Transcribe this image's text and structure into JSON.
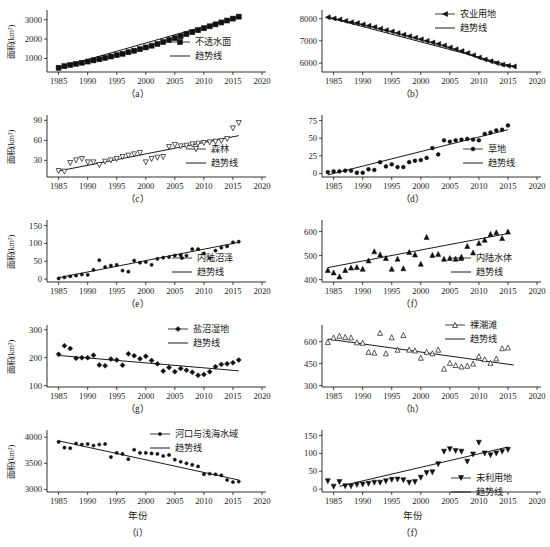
{
  "figure": {
    "y_axis_label": "面积(km²)",
    "x_axis_label": "年份",
    "trend_legend_label": "趋势线",
    "axis_color": "#1a1a1a"
  },
  "panels": [
    {
      "id": "a",
      "label": "（a）",
      "series_name": "不透水面",
      "marker": "square",
      "show_y_label": true,
      "show_x_label": false,
      "legend_x": 170,
      "legend_y": 42
    },
    {
      "id": "b",
      "label": "（b）",
      "series_name": "农业用地",
      "marker": "left-triangle",
      "show_y_label": false,
      "show_x_label": false,
      "legend_x": 160,
      "legend_y": 14
    },
    {
      "id": "c",
      "label": "（c）",
      "series_name": "森林",
      "marker": "down-triangle-open",
      "show_y_label": true,
      "show_x_label": false,
      "legend_x": 186,
      "legend_y": 44
    },
    {
      "id": "d",
      "label": "（d）",
      "series_name": "草地",
      "marker": "circle",
      "show_y_label": false,
      "show_x_label": false,
      "legend_x": 188,
      "legend_y": 44
    },
    {
      "id": "e",
      "label": "（e）",
      "series_name": "内陆沼泽",
      "marker": "dot",
      "show_y_label": true,
      "show_x_label": false,
      "legend_x": 172,
      "legend_y": 48
    },
    {
      "id": "f",
      "label": "（f）",
      "series_name": "内陆水体",
      "marker": "up-triangle",
      "show_y_label": false,
      "show_x_label": false,
      "legend_x": 176,
      "legend_y": 48
    },
    {
      "id": "g",
      "label": "（g）",
      "series_name": "盐沼湿地",
      "marker": "diamond",
      "show_y_label": true,
      "show_x_label": false,
      "legend_x": 168,
      "legend_y": 14
    },
    {
      "id": "h",
      "label": "（h）",
      "series_name": "裸潮滩",
      "marker": "up-triangle-open",
      "show_y_label": false,
      "show_x_label": false,
      "legend_x": 170,
      "legend_y": 10
    },
    {
      "id": "i",
      "label": "（i）",
      "series_name": "河口与浅海水域",
      "marker": "dot",
      "show_y_label": true,
      "show_x_label": true,
      "legend_x": 150,
      "legend_y": 14
    },
    {
      "id": "j",
      "label": "（f）",
      "series_name": "未利用地",
      "marker": "down-triangle",
      "show_y_label": false,
      "show_x_label": true,
      "legend_x": 176,
      "legend_y": 58
    }
  ],
  "chart_data": [
    {
      "type": "scatter",
      "panel": "a",
      "title": "（a）",
      "series_name": "不透水面",
      "trend_name": "趋势线",
      "xlabel": "",
      "ylabel": "面积(km²)",
      "xlim": [
        1983,
        2020
      ],
      "ylim": [
        300,
        3400
      ],
      "xticks": [
        1985,
        1990,
        1995,
        2000,
        2005,
        2010,
        2015,
        2020
      ],
      "yticks": [
        1000,
        2000,
        3000
      ],
      "x": [
        1985,
        1986,
        1987,
        1988,
        1989,
        1990,
        1991,
        1992,
        1993,
        1994,
        1995,
        1996,
        1997,
        1998,
        1999,
        2000,
        2001,
        2002,
        2003,
        2004,
        2005,
        2006,
        2007,
        2008,
        2009,
        2010,
        2011,
        2012,
        2013,
        2014,
        2015,
        2016
      ],
      "y": [
        520,
        600,
        660,
        720,
        780,
        840,
        900,
        960,
        1030,
        1100,
        1170,
        1240,
        1320,
        1400,
        1480,
        1570,
        1660,
        1750,
        1850,
        1950,
        2050,
        2150,
        2260,
        2360,
        2460,
        2560,
        2660,
        2760,
        2860,
        2960,
        3060,
        3160
      ],
      "trend": {
        "x": [
          1985,
          2016
        ],
        "y": [
          520,
          3160
        ]
      },
      "connected": true
    },
    {
      "type": "scatter",
      "panel": "b",
      "title": "（b）",
      "series_name": "农业用地",
      "trend_name": "趋势线",
      "xlabel": "",
      "ylabel": "",
      "xlim": [
        1983,
        2020
      ],
      "ylim": [
        5600,
        8300
      ],
      "xticks": [
        1985,
        1990,
        1995,
        2000,
        2005,
        2010,
        2015,
        2020
      ],
      "yticks": [
        6000,
        7000,
        8000
      ],
      "x": [
        1984,
        1985,
        1986,
        1987,
        1988,
        1989,
        1990,
        1991,
        1992,
        1993,
        1994,
        1995,
        1996,
        1997,
        1998,
        1999,
        2000,
        2001,
        2002,
        2003,
        2004,
        2005,
        2006,
        2007,
        2008,
        2009,
        2010,
        2011,
        2012,
        2013,
        2014,
        2015,
        2016
      ],
      "y": [
        8060,
        8010,
        7960,
        7900,
        7840,
        7800,
        7740,
        7680,
        7620,
        7550,
        7480,
        7420,
        7350,
        7280,
        7210,
        7140,
        7070,
        7000,
        6930,
        6860,
        6790,
        6700,
        6620,
        6540,
        6450,
        6350,
        6250,
        6160,
        6080,
        6000,
        5930,
        5880,
        5850
      ],
      "trend": {
        "x": [
          1984,
          2016
        ],
        "y": [
          8060,
          5850
        ]
      },
      "connected": true
    },
    {
      "type": "scatter",
      "panel": "c",
      "title": "（c）",
      "series_name": "森林",
      "trend_name": "趋势线",
      "xlabel": "",
      "ylabel": "面积(km²)",
      "xlim": [
        1983,
        2020
      ],
      "ylim": [
        5,
        95
      ],
      "xticks": [
        1985,
        1990,
        1995,
        2000,
        2005,
        2010,
        2015,
        2020
      ],
      "yticks": [
        30,
        60,
        90
      ],
      "x": [
        1985,
        1986,
        1987,
        1988,
        1989,
        1990,
        1991,
        1992,
        1993,
        1994,
        1995,
        1996,
        1997,
        1998,
        1999,
        2000,
        2001,
        2002,
        2003,
        2004,
        2005,
        2006,
        2007,
        2008,
        2009,
        2010,
        2011,
        2012,
        2013,
        2014,
        2015,
        2016
      ],
      "y": [
        14,
        13,
        26,
        30,
        32,
        27,
        27,
        23,
        28,
        30,
        32,
        35,
        37,
        39,
        41,
        27,
        32,
        34,
        35,
        50,
        53,
        51,
        52,
        54,
        55,
        56,
        57,
        58,
        59,
        62,
        78,
        86
      ],
      "trend": {
        "x": [
          1985,
          2016
        ],
        "y": [
          14,
          67
        ]
      },
      "connected": false
    },
    {
      "type": "scatter",
      "panel": "d",
      "title": "（d）",
      "series_name": "草地",
      "trend_name": "趋势线",
      "xlabel": "",
      "ylabel": "",
      "xlim": [
        1983,
        2020
      ],
      "ylim": [
        -5,
        80
      ],
      "xticks": [
        1985,
        1990,
        1995,
        2000,
        2005,
        2010,
        2015,
        2020
      ],
      "yticks": [
        0,
        25,
        50,
        75
      ],
      "x": [
        1984,
        1985,
        1986,
        1987,
        1988,
        1989,
        1990,
        1991,
        1992,
        1993,
        1994,
        1995,
        1996,
        1997,
        1998,
        1999,
        2000,
        2001,
        2002,
        2003,
        2004,
        2005,
        2006,
        2007,
        2008,
        2009,
        2010,
        2011,
        2012,
        2013,
        2014,
        2015
      ],
      "y": [
        2,
        3,
        3,
        4,
        4,
        1,
        1,
        6,
        5,
        16,
        10,
        13,
        9,
        9,
        16,
        18,
        19,
        22,
        36,
        27,
        47,
        45,
        47,
        48,
        49,
        48,
        47,
        56,
        58,
        61,
        62,
        68
      ],
      "trend": {
        "x": [
          1984,
          2015
        ],
        "y": [
          -2,
          62
        ]
      },
      "connected": false
    },
    {
      "type": "scatter",
      "panel": "e",
      "title": "（e）",
      "series_name": "内陆沼泽",
      "trend_name": "趋势线",
      "xlabel": "",
      "ylabel": "面积(km²)",
      "xlim": [
        1983,
        2020
      ],
      "ylim": [
        -8,
        160
      ],
      "xticks": [
        1985,
        1990,
        1995,
        2000,
        2005,
        2010,
        2015,
        2020
      ],
      "yticks": [
        0,
        50,
        100,
        150
      ],
      "x": [
        1985,
        1986,
        1987,
        1988,
        1989,
        1990,
        1991,
        1992,
        1993,
        1994,
        1995,
        1996,
        1997,
        1998,
        1999,
        2000,
        2001,
        2002,
        2003,
        2004,
        2005,
        2006,
        2007,
        2008,
        2009,
        2010,
        2011,
        2012,
        2013,
        2014,
        2015,
        2016
      ],
      "y": [
        2,
        5,
        8,
        10,
        13,
        12,
        26,
        53,
        34,
        38,
        40,
        24,
        21,
        52,
        46,
        48,
        40,
        57,
        60,
        62,
        66,
        67,
        66,
        84,
        84,
        72,
        59,
        80,
        88,
        92,
        103,
        105
      ],
      "trend": {
        "x": [
          1985,
          2016
        ],
        "y": [
          4,
          103
        ]
      },
      "connected": false
    },
    {
      "type": "scatter",
      "panel": "f",
      "title": "（f）",
      "series_name": "内陆水体",
      "trend_name": "趋势线",
      "xlabel": "",
      "ylabel": "",
      "xlim": [
        1983,
        2020
      ],
      "ylim": [
        390,
        640
      ],
      "xticks": [
        1985,
        1990,
        1995,
        2000,
        2005,
        2010,
        2015,
        2020
      ],
      "yticks": [
        400,
        500,
        600
      ],
      "x": [
        1984,
        1985,
        1986,
        1987,
        1988,
        1989,
        1990,
        1991,
        1992,
        1993,
        1994,
        1995,
        1996,
        1997,
        1998,
        1999,
        2000,
        2001,
        2002,
        2003,
        2004,
        2005,
        2006,
        2007,
        2008,
        2009,
        2010,
        2011,
        2012,
        2013,
        2014,
        2015
      ],
      "y": [
        440,
        430,
        413,
        440,
        450,
        452,
        445,
        480,
        518,
        505,
        490,
        445,
        487,
        447,
        515,
        505,
        466,
        578,
        503,
        507,
        487,
        490,
        487,
        495,
        540,
        513,
        553,
        566,
        590,
        597,
        573,
        600
      ],
      "trend": {
        "x": [
          1984,
          2015
        ],
        "y": [
          450,
          592
        ]
      },
      "connected": false
    },
    {
      "type": "scatter",
      "panel": "g",
      "title": "（g）",
      "series_name": "盐沼湿地",
      "trend_name": "趋势线",
      "xlabel": "",
      "ylabel": "面积(km²)",
      "xlim": [
        1983,
        2020
      ],
      "ylim": [
        95,
        310
      ],
      "xticks": [
        1985,
        1990,
        1995,
        2000,
        2005,
        2010,
        2015,
        2020
      ],
      "yticks": [
        100,
        200,
        300
      ],
      "x": [
        1985,
        1986,
        1987,
        1988,
        1989,
        1990,
        1991,
        1992,
        1993,
        1994,
        1995,
        1996,
        1997,
        1998,
        1999,
        2000,
        2001,
        2002,
        2003,
        2004,
        2005,
        2006,
        2007,
        2008,
        2009,
        2010,
        2011,
        2012,
        2013,
        2014,
        2015,
        2016
      ],
      "y": [
        212,
        243,
        233,
        198,
        200,
        200,
        209,
        174,
        171,
        195,
        192,
        173,
        214,
        207,
        196,
        205,
        190,
        178,
        152,
        165,
        150,
        161,
        155,
        148,
        137,
        140,
        150,
        168,
        176,
        178,
        182,
        192
      ],
      "trend": {
        "x": [
          1985,
          2016
        ],
        "y": [
          208,
          153
        ]
      },
      "connected": false
    },
    {
      "type": "scatter",
      "panel": "h",
      "title": "（h）",
      "series_name": "裸潮滩",
      "trend_name": "趋势线",
      "xlabel": "",
      "ylabel": "",
      "xlim": [
        1983,
        2020
      ],
      "ylim": [
        290,
        700
      ],
      "xticks": [
        1985,
        1990,
        1995,
        2000,
        2005,
        2010,
        2015,
        2020
      ],
      "yticks": [
        300,
        450,
        600
      ],
      "x": [
        1984,
        1985,
        1986,
        1987,
        1988,
        1989,
        1990,
        1991,
        1992,
        1993,
        1994,
        1995,
        1996,
        1997,
        1998,
        1999,
        2000,
        2001,
        2002,
        2003,
        2004,
        2005,
        2006,
        2007,
        2008,
        2009,
        2010,
        2011,
        2012,
        2013,
        2014,
        2015
      ],
      "y": [
        598,
        628,
        640,
        632,
        628,
        595,
        592,
        530,
        525,
        660,
        520,
        630,
        545,
        645,
        545,
        540,
        490,
        530,
        520,
        545,
        415,
        455,
        440,
        430,
        435,
        450,
        500,
        480,
        455,
        485,
        555,
        560
      ],
      "trend": {
        "x": [
          1984,
          2016
        ],
        "y": [
          618,
          440
        ]
      },
      "connected": false
    },
    {
      "type": "scatter",
      "panel": "i",
      "title": "（i）",
      "series_name": "河口与浅海水域",
      "trend_name": "趋势线",
      "xlabel": "年份",
      "ylabel": "面积(km²)",
      "xlim": [
        1983,
        2020
      ],
      "ylim": [
        2950,
        4100
      ],
      "xticks": [
        1985,
        1990,
        1995,
        2000,
        2005,
        2010,
        2015,
        2020
      ],
      "yticks": [
        3000,
        3500,
        4000
      ],
      "x": [
        1985,
        1986,
        1987,
        1988,
        1989,
        1990,
        1991,
        1992,
        1993,
        1994,
        1995,
        1996,
        1997,
        1998,
        1999,
        2000,
        2001,
        2002,
        2003,
        2004,
        2005,
        2006,
        2007,
        2008,
        2009,
        2010,
        2011,
        2012,
        2013,
        2014,
        2015,
        2016
      ],
      "y": [
        3910,
        3800,
        3790,
        3880,
        3860,
        3870,
        3840,
        3860,
        3870,
        3620,
        3700,
        3680,
        3580,
        3760,
        3700,
        3700,
        3690,
        3680,
        3640,
        3660,
        3570,
        3530,
        3500,
        3470,
        3440,
        3290,
        3300,
        3290,
        3270,
        3180,
        3140,
        3150
      ],
      "trend": {
        "x": [
          1985,
          2016
        ],
        "y": [
          3930,
          3180
        ]
      },
      "connected": false
    },
    {
      "type": "scatter",
      "panel": "j",
      "title": "（f）",
      "series_name": "未利用地",
      "trend_name": "趋势线",
      "xlabel": "年份",
      "ylabel": "",
      "xlim": [
        1983,
        2020
      ],
      "ylim": [
        -8,
        160
      ],
      "xticks": [
        1985,
        1990,
        1995,
        2000,
        2005,
        2010,
        2015,
        2020
      ],
      "yticks": [
        0,
        50,
        100,
        150
      ],
      "x": [
        1984,
        1985,
        1986,
        1987,
        1988,
        1989,
        1990,
        1991,
        1992,
        1993,
        1994,
        1995,
        1996,
        1997,
        1998,
        1999,
        2000,
        2001,
        2002,
        2003,
        2004,
        2005,
        2006,
        2007,
        2008,
        2009,
        2010,
        2011,
        2012,
        2013,
        2014,
        2015
      ],
      "y": [
        22,
        7,
        20,
        8,
        8,
        12,
        13,
        15,
        18,
        18,
        22,
        26,
        27,
        25,
        18,
        20,
        32,
        45,
        47,
        70,
        105,
        112,
        107,
        105,
        77,
        97,
        130,
        100,
        95,
        100,
        105,
        110
      ],
      "trend": {
        "x": [
          1986,
          2015
        ],
        "y": [
          8,
          118
        ]
      },
      "connected": false
    }
  ]
}
